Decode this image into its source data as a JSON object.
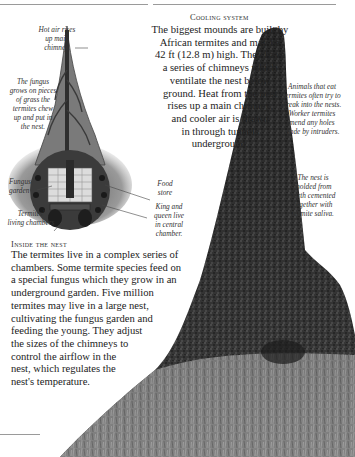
{
  "cooling_system": {
    "heading": "Cooling system",
    "body_lines": [
      "The biggest mounds are built by",
      "African termites and may be",
      "42 ft (12.8 m) high. They have",
      "a series of chimneys which",
      "ventilate the nest below",
      "ground. Heat from the nest",
      "rises up a main chimney,",
      "and cooler air is drawn",
      "in through tunnels",
      "underground."
    ]
  },
  "inside_the_nest": {
    "heading": "Inside the nest",
    "body_lines": [
      "The termites live in a complex series of",
      "chambers. Some termite species feed on",
      "a special fungus which they grow in an",
      "underground garden. Five million",
      "termites may live in a large nest,",
      "cultivating the fungus garden and",
      "feeding the young. They adjust",
      "the sizes of the chimneys to",
      "control the airflow in the",
      "nest, which regulates the",
      "nest's temperature."
    ]
  },
  "diagram_labels": {
    "hot_air": [
      "Hot air rises",
      "up main",
      "chimney."
    ],
    "fungus_grows": [
      "The fungus",
      "grows on pieces",
      "of grass the",
      "termites chew",
      "up and put in",
      "the nest."
    ],
    "fungus_garden": [
      "Fungus",
      "garden"
    ],
    "living_chambers": [
      "Termites'",
      "living chambers"
    ],
    "food_store": [
      "Food",
      "store"
    ],
    "king_queen": [
      "King and",
      "queen live",
      "in central",
      "chamber."
    ]
  },
  "photo_captions": {
    "animals": [
      "Animals that eat",
      "termites often try to",
      "break into the nests.",
      "Worker termites",
      "mend any holes",
      "made by intruders."
    ],
    "nest_molded": [
      "The nest is",
      "molded from",
      "earth cemented",
      "together with",
      "termite saliva."
    ]
  }
}
